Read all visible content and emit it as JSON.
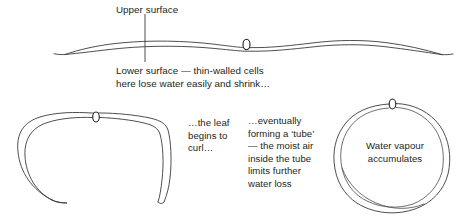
{
  "figure": {
    "background_color": "#ffffff",
    "ink_color": "#3b3a3c",
    "text_color": "#231f20"
  },
  "labels": {
    "upper_surface": "Upper surface",
    "lower_surface": "Lower surface — thin-walled cells\nhere lose water easily and shrink…",
    "leaf_curl": "…the leaf\nbegins to\ncurl…",
    "tube": "…eventually\nforming a ‘tube’\n— the moist air\ninside the tube\nlimits further\nwater loss",
    "water_vapour": "Water vapour\naccumulates"
  },
  "panels": [
    {
      "id": "panel-flat-leaf",
      "name": "flat-leaf-cross-section",
      "description": "Flat wavy leaf cross-section with a single stoma on the lower surface",
      "stoma_count": 1
    },
    {
      "id": "panel-curling-leaf",
      "name": "curling-leaf-cross-section",
      "description": "Leaf curling into an arch, stoma at apex",
      "stoma_count": 1
    },
    {
      "id": "panel-tube-leaf",
      "name": "rolled-tube-leaf-cross-section",
      "description": "Leaf rolled into a closed tube, stoma at top",
      "stoma_count": 1
    }
  ],
  "annotations": {
    "leader_line": {
      "name": "upper-surface-leader-line",
      "from_y": 14,
      "to_y": 62,
      "x": 145
    }
  }
}
